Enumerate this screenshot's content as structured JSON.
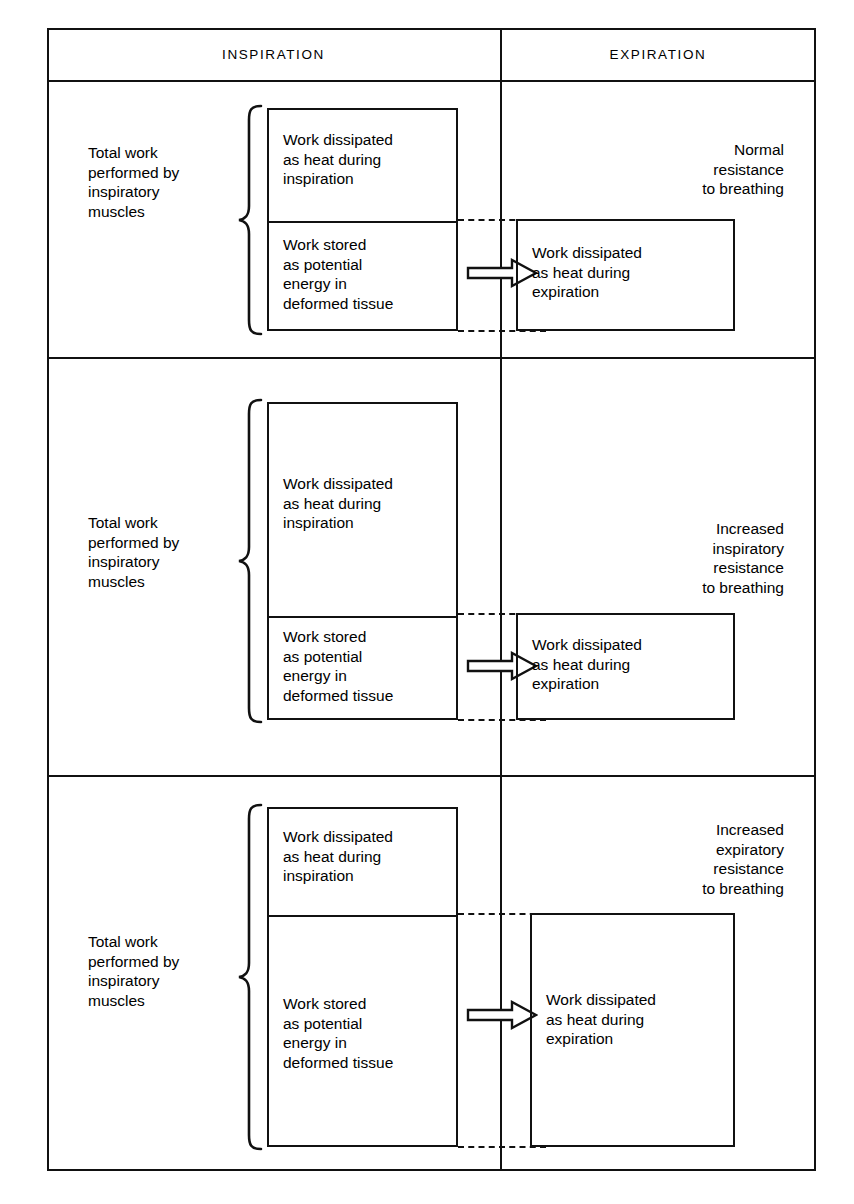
{
  "diagram": {
    "columns": [
      {
        "key": "inspiration",
        "label": "INSPIRATION"
      },
      {
        "key": "expiration",
        "label": "EXPIRATION"
      }
    ],
    "brace_label": "Total work\nperformed by\ninspiratory\nmuscles",
    "rows": [
      {
        "id": "normal",
        "condition": "Normal\nresistance\nto breathing",
        "brace_label": "Total work\nperformed by\ninspiratory\nmuscles",
        "inspiration_boxes": [
          {
            "id": "heat-insp",
            "text": "Work dissipated\nas heat during\ninspiration"
          },
          {
            "id": "stored-pe",
            "text": "Work stored\nas potential\nenergy in\ndeformed tissue"
          }
        ],
        "expiration_box": {
          "id": "heat-exp",
          "text": "Work dissipated\nas heat during\nexpiration"
        },
        "arrow": "hollow-right-arrow"
      },
      {
        "id": "increased-inspiratory",
        "condition": "Increased\ninspiratory\nresistance\nto breathing",
        "brace_label": "Total work\nperformed by\ninspiratory\nmuscles",
        "inspiration_boxes": [
          {
            "id": "heat-insp",
            "text": "Work dissipated\nas heat during\ninspiration"
          },
          {
            "id": "stored-pe",
            "text": "Work stored\nas potential\nenergy in\ndeformed tissue"
          }
        ],
        "expiration_box": {
          "id": "heat-exp",
          "text": "Work dissipated\nas heat during\nexpiration"
        },
        "arrow": "hollow-right-arrow"
      },
      {
        "id": "increased-expiratory",
        "condition": "Increased\nexpiratory\nresistance\nto breathing",
        "brace_label": "Total work\nperformed by\ninspiratory\nmuscles",
        "inspiration_boxes": [
          {
            "id": "heat-insp",
            "text": "Work dissipated\nas heat during\ninspiration"
          },
          {
            "id": "stored-pe",
            "text": "Work stored\nas potential\nenergy in\ndeformed tissue"
          }
        ],
        "expiration_box": {
          "id": "heat-exp",
          "text": "Work dissipated\nas heat during\nexpiration"
        },
        "arrow": "hollow-right-arrow"
      }
    ],
    "colors": {
      "ink": "#111111",
      "paper": "#ffffff"
    }
  }
}
